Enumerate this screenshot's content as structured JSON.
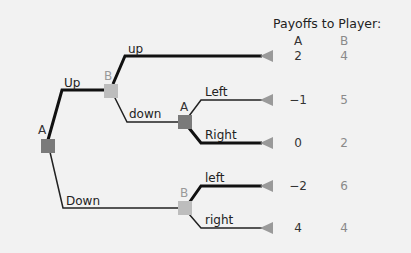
{
  "header": {
    "title": "Payoffs to Player:",
    "col_a": "A",
    "col_b": "B"
  },
  "colors": {
    "player_a_node": "#7a7a7a",
    "player_b_node": "#bdbdbd",
    "thick_edge": "#111111",
    "thin_edge": "#333333",
    "terminal": "#9a9a9a"
  },
  "nodes": {
    "root": {
      "player": "A"
    },
    "b_upper": {
      "player": "B"
    },
    "a_mid": {
      "player": "A"
    },
    "b_lower": {
      "player": "B"
    }
  },
  "edges": {
    "up_cap": "Up",
    "down_cap": "Down",
    "up_small": "up",
    "down_small": "down",
    "left_cap": "Left",
    "right_cap": "Right",
    "left_small": "left",
    "right_small": "right"
  },
  "payoffs": [
    {
      "a": "2",
      "b": "4"
    },
    {
      "a": "−1",
      "b": "5"
    },
    {
      "a": "0",
      "b": "2"
    },
    {
      "a": "−2",
      "b": "6"
    },
    {
      "a": "4",
      "b": "4"
    }
  ]
}
